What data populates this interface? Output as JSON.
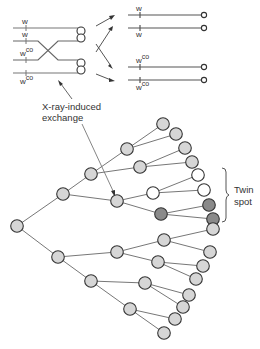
{
  "chromosomes": {
    "left_labels": [
      "w",
      "w",
      "w",
      "w"
    ],
    "left_superscripts": [
      "",
      "",
      "co",
      "co"
    ],
    "right_labels": [
      "w",
      "w",
      "w",
      "w"
    ],
    "right_superscripts": [
      "",
      "",
      "co",
      "co"
    ]
  },
  "annotation": {
    "line1": "X-ray-induced",
    "line2": "exchange"
  },
  "twin_spot": {
    "line1": "Twin",
    "line2": "spot"
  },
  "colors": {
    "light_cell": "#d6d6d6",
    "white_cell": "#ffffff",
    "dark_cell": "#8a8a8a",
    "stroke": "#333333",
    "line": "#777777"
  },
  "tree": {
    "nodes": [
      {
        "id": "root",
        "x": 17,
        "y": 226,
        "type": "light"
      },
      {
        "id": "a",
        "x": 63,
        "y": 194,
        "type": "light"
      },
      {
        "id": "b",
        "x": 58,
        "y": 257,
        "type": "light"
      },
      {
        "id": "a1",
        "x": 91,
        "y": 174,
        "type": "light"
      },
      {
        "id": "a2",
        "x": 117,
        "y": 201,
        "type": "light"
      },
      {
        "id": "a1a",
        "x": 127,
        "y": 149,
        "type": "light"
      },
      {
        "id": "a1b",
        "x": 140,
        "y": 167,
        "type": "light"
      },
      {
        "id": "a1a1",
        "x": 163,
        "y": 124,
        "type": "light"
      },
      {
        "id": "a1a2",
        "x": 176,
        "y": 134,
        "type": "light"
      },
      {
        "id": "a1b1",
        "x": 185,
        "y": 148,
        "type": "light"
      },
      {
        "id": "a1b2",
        "x": 192,
        "y": 162,
        "type": "light"
      },
      {
        "id": "a2a",
        "x": 153,
        "y": 193,
        "type": "white"
      },
      {
        "id": "a2b",
        "x": 161,
        "y": 214,
        "type": "dark"
      },
      {
        "id": "a2a1",
        "x": 198,
        "y": 175,
        "type": "white"
      },
      {
        "id": "a2a2",
        "x": 204,
        "y": 190,
        "type": "white"
      },
      {
        "id": "a2b1",
        "x": 209,
        "y": 205,
        "type": "dark"
      },
      {
        "id": "a2b2",
        "x": 213,
        "y": 219,
        "type": "dark"
      },
      {
        "id": "b1",
        "x": 117,
        "y": 252,
        "type": "light"
      },
      {
        "id": "b2",
        "x": 91,
        "y": 281,
        "type": "light"
      },
      {
        "id": "b1a",
        "x": 164,
        "y": 240,
        "type": "light"
      },
      {
        "id": "b1b",
        "x": 158,
        "y": 262,
        "type": "light"
      },
      {
        "id": "b1a1",
        "x": 213,
        "y": 229,
        "type": "light"
      },
      {
        "id": "b1a2",
        "x": 210,
        "y": 252,
        "type": "light"
      },
      {
        "id": "b1b1",
        "x": 203,
        "y": 266,
        "type": "light"
      },
      {
        "id": "b1b2",
        "x": 196,
        "y": 279,
        "type": "light"
      },
      {
        "id": "b2a",
        "x": 145,
        "y": 283,
        "type": "light"
      },
      {
        "id": "b2b",
        "x": 130,
        "y": 309,
        "type": "light"
      },
      {
        "id": "b2a1",
        "x": 189,
        "y": 295,
        "type": "light"
      },
      {
        "id": "b2a2",
        "x": 183,
        "y": 307,
        "type": "light"
      },
      {
        "id": "b2b1",
        "x": 175,
        "y": 319,
        "type": "light"
      },
      {
        "id": "b2b2",
        "x": 164,
        "y": 333,
        "type": "light"
      }
    ]
  }
}
